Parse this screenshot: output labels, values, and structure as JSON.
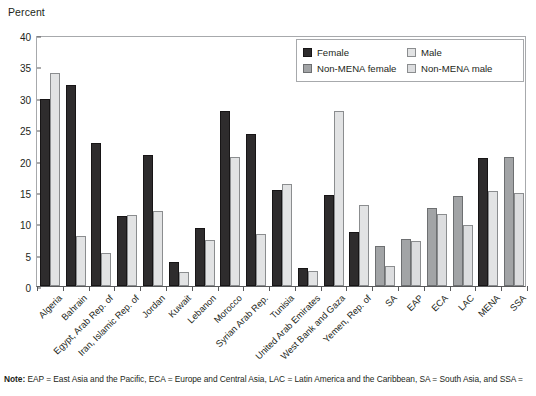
{
  "axis_title": "Percent",
  "note_label": "Note:",
  "note_text": " EAP = East Asia and the Pacific, ECA = Europe and Central Asia, LAC = Latin America and the Caribbean, SA = South Asia, and SSA =",
  "legend": {
    "items": [
      {
        "key": "female",
        "label": "Female",
        "color": "#2e2c2d"
      },
      {
        "key": "male",
        "label": "Male",
        "color": "#e2e3e4"
      },
      {
        "key": "nmfemale",
        "label": "Non-MENA female",
        "color": "#a2a4a6"
      },
      {
        "key": "nmmale",
        "label": "Non-MENA male",
        "color": "#dcdddf"
      }
    ]
  },
  "chart_data": {
    "type": "bar",
    "title": "",
    "xlabel": "",
    "ylabel": "Percent",
    "ylim": [
      0,
      40
    ],
    "yticks": [
      0,
      5,
      10,
      15,
      20,
      25,
      30,
      35,
      40
    ],
    "grid": false,
    "legend_position": "top-right",
    "categories": [
      "Algeria",
      "Bahrain",
      "Egypt, Arab Rep. of",
      "Iran, Islamic Rep. of",
      "Jordan",
      "Kuwait",
      "Lebanon",
      "Morocco",
      "Syrian Arab Rep.",
      "Tunisia",
      "United Arab Emirates",
      "West Bank and Gaza",
      "Yemen, Rep. of",
      "SA",
      "EAP",
      "ECA",
      "LAC",
      "MENA",
      "SSA"
    ],
    "series": [
      {
        "name": "Female",
        "key": "female",
        "color": "#2e2c2d",
        "values": [
          29.8,
          32.0,
          22.8,
          11.1,
          20.8,
          3.9,
          9.3,
          27.9,
          24.2,
          15.3,
          2.9,
          14.5,
          8.6,
          null,
          null,
          null,
          null,
          20.4,
          null
        ]
      },
      {
        "name": "Male",
        "key": "male",
        "color": "#e2e3e4",
        "values": [
          34.0,
          7.9,
          5.2,
          11.3,
          11.9,
          2.3,
          7.4,
          20.5,
          8.3,
          16.2,
          2.4,
          27.9,
          12.9,
          null,
          null,
          null,
          null,
          15.1,
          null
        ]
      },
      {
        "name": "Non-MENA female",
        "key": "nmfemale",
        "color": "#a2a4a6",
        "values": [
          null,
          null,
          null,
          null,
          null,
          null,
          null,
          null,
          null,
          null,
          null,
          null,
          null,
          6.4,
          7.5,
          12.5,
          14.3,
          null,
          20.5
        ]
      },
      {
        "name": "Non-MENA male",
        "key": "nmmale",
        "color": "#dcdddf",
        "values": [
          null,
          null,
          null,
          null,
          null,
          null,
          null,
          null,
          null,
          null,
          null,
          null,
          null,
          3.2,
          7.1,
          11.4,
          9.8,
          null,
          14.9
        ]
      }
    ]
  }
}
